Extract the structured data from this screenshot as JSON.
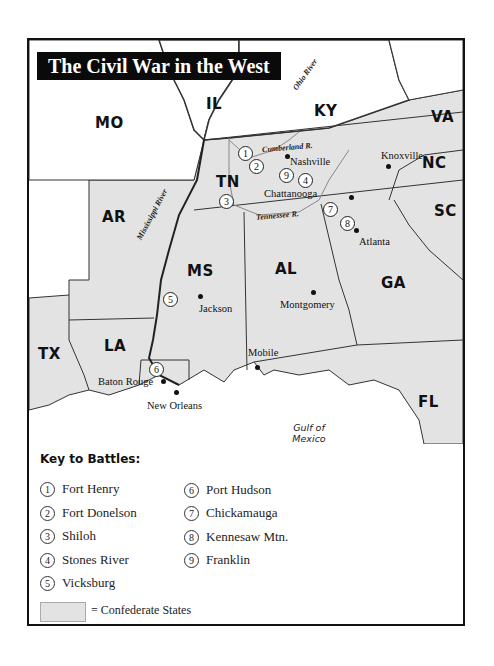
{
  "title": "The Civil War in the West",
  "colors": {
    "confederate_fill": "#e3e3e3",
    "union_fill": "#ffffff",
    "title_bg": "#0a0a0a",
    "title_text": "#ffffff",
    "border": "#111111"
  },
  "states": [
    {
      "abbr": "MO",
      "confederate": false
    },
    {
      "abbr": "IL",
      "confederate": false
    },
    {
      "abbr": "KY",
      "confederate": false
    },
    {
      "abbr": "VA",
      "confederate": true
    },
    {
      "abbr": "NC",
      "confederate": true
    },
    {
      "abbr": "TN",
      "confederate": true
    },
    {
      "abbr": "AR",
      "confederate": true
    },
    {
      "abbr": "SC",
      "confederate": true
    },
    {
      "abbr": "MS",
      "confederate": true
    },
    {
      "abbr": "AL",
      "confederate": true
    },
    {
      "abbr": "GA",
      "confederate": true
    },
    {
      "abbr": "TX",
      "confederate": true
    },
    {
      "abbr": "LA",
      "confederate": true
    },
    {
      "abbr": "FL",
      "confederate": true
    }
  ],
  "cities": [
    {
      "name": "Nashville"
    },
    {
      "name": "Knoxville"
    },
    {
      "name": "Chattanooga"
    },
    {
      "name": "Atlanta"
    },
    {
      "name": "Jackson"
    },
    {
      "name": "Montgomery"
    },
    {
      "name": "Mobile"
    },
    {
      "name": "Baton Rouge"
    },
    {
      "name": "New Orleans"
    }
  ],
  "rivers": [
    {
      "name": "Ohio River"
    },
    {
      "name": "Cumberland R."
    },
    {
      "name": "Tennessee R."
    },
    {
      "name": "Mississippi River"
    }
  ],
  "water_bodies": [
    {
      "line1": "Gulf of",
      "line2": "Mexico"
    }
  ],
  "key": {
    "title": "Key to Battles:",
    "battles": [
      {
        "num": "1",
        "name": "Fort Henry"
      },
      {
        "num": "2",
        "name": "Fort Donelson"
      },
      {
        "num": "3",
        "name": "Shiloh"
      },
      {
        "num": "4",
        "name": "Stones River"
      },
      {
        "num": "5",
        "name": "Vicksburg"
      },
      {
        "num": "6",
        "name": "Port Hudson"
      },
      {
        "num": "7",
        "name": "Chickamauga"
      },
      {
        "num": "8",
        "name": "Kennesaw Mtn."
      },
      {
        "num": "9",
        "name": "Franklin"
      }
    ],
    "legend_label": "= Confederate States"
  }
}
